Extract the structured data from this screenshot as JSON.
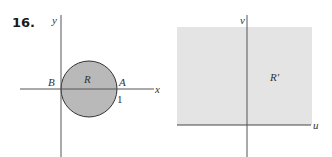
{
  "problem_number": "16.",
  "left_figure": {
    "x_axis_label": "x",
    "y_axis_label": "y",
    "region_label": "R",
    "point_a_label": "A",
    "point_b_label": "B",
    "tick_label": "1",
    "region_shape": "disk",
    "region_fill": "#b9b9b9",
    "outline_color": "#333333"
  },
  "right_figure": {
    "u_axis_label": "u",
    "v_axis_label": "v",
    "region_label": "R′",
    "region_shape": "rectangle",
    "region_fill": "#e4e4e4",
    "axis_color": "#444444"
  }
}
